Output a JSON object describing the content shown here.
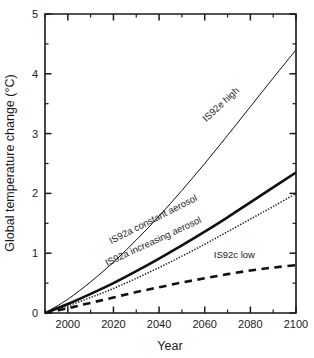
{
  "chart_data": {
    "type": "line",
    "title": "",
    "xlabel": "Year",
    "ylabel": "Global temperature change (°C)",
    "xlim": [
      1990,
      2100
    ],
    "ylim": [
      0,
      5
    ],
    "grid": false,
    "legend_position": "inline-curve-labels",
    "x_ticks_major": [
      2000,
      2020,
      2040,
      2060,
      2080,
      2100
    ],
    "x_ticks_major_labels": [
      "2000",
      "2020",
      "2040",
      "2060",
      "2080",
      "2100"
    ],
    "x_ticks_minor": [
      1990,
      2010,
      2030,
      2050,
      2070,
      2090
    ],
    "y_ticks_major": [
      0,
      1,
      2,
      3,
      4,
      5
    ],
    "y_ticks_major_labels": [
      "0",
      "1",
      "2",
      "3",
      "4",
      "5"
    ],
    "y_ticks_minor": [
      0.5,
      1.5,
      2.5,
      3.5,
      4.5
    ],
    "x": [
      1990,
      2000,
      2010,
      2020,
      2030,
      2040,
      2050,
      2060,
      2070,
      2080,
      2090,
      2100
    ],
    "series": [
      {
        "name": "IS92e high",
        "style": "thin-solid",
        "label_x": 2068,
        "label_y": 3.45,
        "label_angle": -43,
        "values": [
          0,
          0.23,
          0.52,
          0.85,
          1.22,
          1.62,
          2.05,
          2.5,
          2.97,
          3.45,
          3.93,
          4.4
        ]
      },
      {
        "name": "IS92a constant aerosol",
        "style": "thick-solid",
        "label_x": 2038,
        "label_y": 1.52,
        "label_angle": -27,
        "values": [
          0,
          0.15,
          0.32,
          0.5,
          0.7,
          0.91,
          1.13,
          1.36,
          1.6,
          1.85,
          2.1,
          2.35
        ]
      },
      {
        "name": "IS92a increasing aerosol",
        "style": "dotted",
        "label_x": 2038,
        "label_y": 1.15,
        "label_angle": -25,
        "values": [
          0,
          0.12,
          0.26,
          0.41,
          0.58,
          0.76,
          0.95,
          1.15,
          1.36,
          1.57,
          1.78,
          2.0
        ]
      },
      {
        "name": "IS92c low",
        "style": "dashed",
        "label_x": 2073,
        "label_y": 0.92,
        "label_angle": 0,
        "values": [
          0,
          0.08,
          0.17,
          0.26,
          0.35,
          0.43,
          0.51,
          0.58,
          0.65,
          0.71,
          0.76,
          0.8
        ]
      }
    ]
  },
  "colors": {
    "axis": "#1a1a1a",
    "curve": "#111111",
    "background": "#ffffff"
  }
}
